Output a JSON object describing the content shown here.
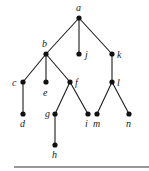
{
  "diagram": {
    "type": "rooted-tree",
    "nodes": [
      {
        "id": "a",
        "label": "a",
        "x": 79,
        "y": 18,
        "lx": 76,
        "ly": 11
      },
      {
        "id": "b",
        "label": "b",
        "x": 46,
        "y": 54,
        "lx": 42,
        "ly": 47
      },
      {
        "id": "j",
        "label": "j",
        "x": 79,
        "y": 54,
        "lx": 85,
        "ly": 58
      },
      {
        "id": "k",
        "label": "k",
        "x": 112,
        "y": 54,
        "lx": 117,
        "ly": 58
      },
      {
        "id": "c",
        "label": "c",
        "x": 23,
        "y": 82,
        "lx": 12,
        "ly": 86
      },
      {
        "id": "e",
        "label": "e",
        "x": 46,
        "y": 82,
        "lx": 43,
        "ly": 96
      },
      {
        "id": "f",
        "label": "f",
        "x": 70,
        "y": 82,
        "lx": 75,
        "ly": 86
      },
      {
        "id": "l",
        "label": "l",
        "x": 112,
        "y": 82,
        "lx": 117,
        "ly": 86
      },
      {
        "id": "d",
        "label": "d",
        "x": 23,
        "y": 114,
        "lx": 20,
        "ly": 127
      },
      {
        "id": "g",
        "label": "g",
        "x": 55,
        "y": 114,
        "lx": 45,
        "ly": 117
      },
      {
        "id": "i",
        "label": "i",
        "x": 88,
        "y": 114,
        "lx": 85,
        "ly": 127
      },
      {
        "id": "m",
        "label": "m",
        "x": 97,
        "y": 114,
        "lx": 93,
        "ly": 127
      },
      {
        "id": "n",
        "label": "n",
        "x": 129,
        "y": 114,
        "lx": 126,
        "ly": 127
      },
      {
        "id": "h",
        "label": "h",
        "x": 55,
        "y": 145,
        "lx": 52,
        "ly": 158
      }
    ],
    "edges": [
      [
        "a",
        "b"
      ],
      [
        "a",
        "j"
      ],
      [
        "a",
        "k"
      ],
      [
        "b",
        "c"
      ],
      [
        "b",
        "e"
      ],
      [
        "b",
        "f"
      ],
      [
        "k",
        "l"
      ],
      [
        "c",
        "d"
      ],
      [
        "f",
        "g"
      ],
      [
        "f",
        "i"
      ],
      [
        "l",
        "m"
      ],
      [
        "l",
        "n"
      ],
      [
        "g",
        "h"
      ]
    ],
    "rule": {
      "x1": 14,
      "y1": 167,
      "x2": 149,
      "y2": 167
    }
  }
}
